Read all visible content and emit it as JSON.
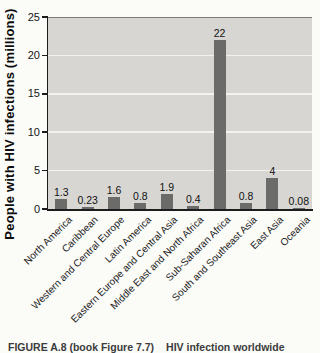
{
  "chart_data": {
    "type": "bar",
    "title": "",
    "xlabel": "",
    "ylabel": "People with HIV infections (millions)",
    "ylim": [
      0,
      25
    ],
    "yticks": [
      0,
      5,
      10,
      15,
      20,
      25
    ],
    "grid": "horizontal light gridlines on gray plot background",
    "legend": "none",
    "categories": [
      "North America",
      "Caribbean",
      "Western and Central Europe",
      "Latin America",
      "Eastern Europe and Central Asia",
      "Middle East and North Africa",
      "Sub-Saharan Africa",
      "South and Southeast Asia",
      "East Asia",
      "Oceania"
    ],
    "values": [
      1.3,
      0.23,
      1.6,
      0.8,
      1.9,
      0.4,
      22,
      0.8,
      4,
      0.08
    ],
    "value_labels": [
      "1.3",
      "0.23",
      "1.6",
      "0.8",
      "1.9",
      "0.4",
      "22",
      "0.8",
      "4",
      "0.08"
    ],
    "bar_color": "#6b6b69",
    "plot_bg": "#d7d6d3",
    "gridline_color": "#f3f2ef"
  },
  "caption": {
    "figure_label": "FIGURE A.8 (book Figure 7.7)",
    "title": "HIV infection worldwide"
  }
}
